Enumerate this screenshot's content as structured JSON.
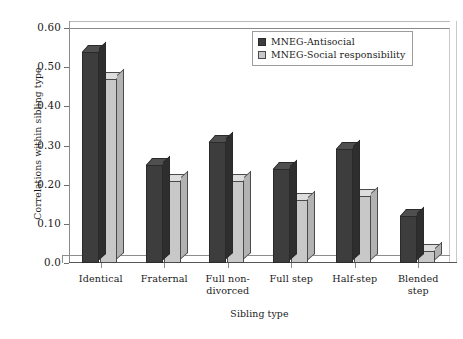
{
  "chart_data": {
    "type": "bar",
    "title": "",
    "xlabel": "Sibling type",
    "ylabel": "Correlations within sibling type",
    "ylim": [
      0.0,
      0.6
    ],
    "yticks": [
      "0.0",
      "0.10",
      "0.20",
      "0.30",
      "0.40",
      "0.50",
      "0.60"
    ],
    "ytick_values": [
      0.0,
      0.1,
      0.2,
      0.3,
      0.4,
      0.5,
      0.6
    ],
    "grid": false,
    "legend_position": "top-right",
    "categories": [
      "Identical",
      "Fraternal",
      "Full non-divorced",
      "Full step",
      "Half-step",
      "Blended step"
    ],
    "category_lines": [
      [
        "Identical"
      ],
      [
        "Fraternal"
      ],
      [
        "Full non-",
        "divorced"
      ],
      [
        "Full step"
      ],
      [
        "Half-step"
      ],
      [
        "Blended",
        "step"
      ]
    ],
    "series": [
      {
        "name": "MNEG-Antisocial",
        "color": "#3d3d3d",
        "values": [
          0.54,
          0.25,
          0.31,
          0.24,
          0.29,
          0.12
        ]
      },
      {
        "name": "MNEG-Social responsibility",
        "color": "#c8c8c8",
        "values": [
          0.47,
          0.21,
          0.21,
          0.16,
          0.17,
          0.03
        ]
      }
    ]
  },
  "legend": {
    "entries": [
      {
        "label": "MNEG-Antisocial",
        "swatch": "dark-square-swatch"
      },
      {
        "label": "MNEG-Social responsibility",
        "swatch": "light-square-swatch"
      }
    ]
  }
}
